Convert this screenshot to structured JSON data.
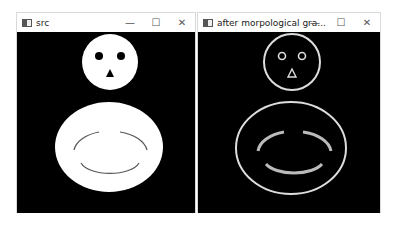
{
  "windows": [
    {
      "title": "src",
      "controls": {
        "minimize": "—",
        "maximize": "☐",
        "close": "✕"
      },
      "image": "filled-snowman-silhouette"
    },
    {
      "title": "after morpological gra...",
      "controls": {
        "minimize": "—",
        "maximize": "☐",
        "close": "✕"
      },
      "image": "morphological-gradient-outline"
    }
  ],
  "colors": {
    "background": "#000000",
    "shape": "#ffffff"
  }
}
